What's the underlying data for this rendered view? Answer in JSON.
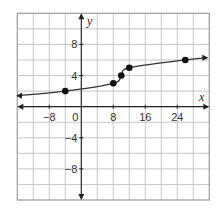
{
  "chart_data": {
    "type": "line",
    "title": "",
    "xlabel": "x",
    "ylabel": "y",
    "xlim": [
      -16,
      32
    ],
    "ylim": [
      -12,
      12
    ],
    "x_grid_step": 4,
    "y_grid_step": 2,
    "grid": true,
    "x_tick_labels": [
      "-8",
      "0",
      "8",
      "16",
      "24"
    ],
    "x_ticks": [
      -8,
      0,
      8,
      16,
      24
    ],
    "y_tick_labels": [
      "8",
      "4",
      "-4",
      "-8"
    ],
    "y_ticks": [
      8,
      4,
      -4,
      -8
    ],
    "points": [
      {
        "x": -4,
        "y": 2
      },
      {
        "x": 8,
        "y": 3
      },
      {
        "x": 10,
        "y": 4
      },
      {
        "x": 12,
        "y": 5
      },
      {
        "x": 26,
        "y": 6
      }
    ],
    "curve_description": "Smooth increasing curve through points with arrows on both ends",
    "legend": []
  },
  "labels": {
    "x_axis": "x",
    "y_axis": "y",
    "origin": "0"
  }
}
